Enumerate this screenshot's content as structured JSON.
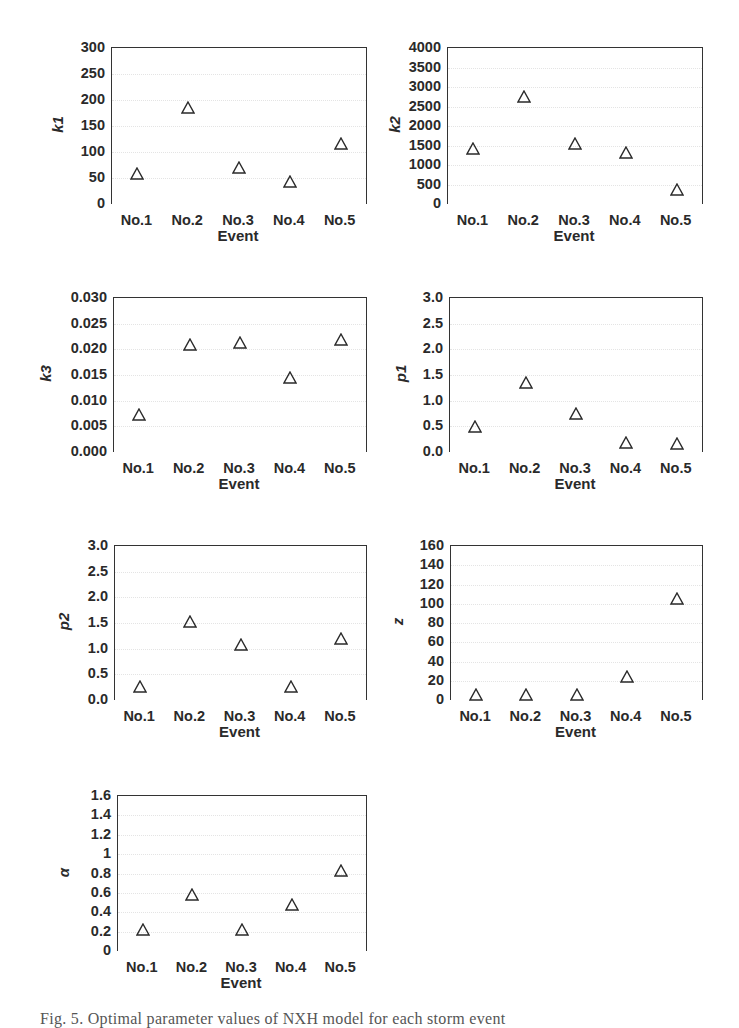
{
  "figure": {
    "caption": "Fig. 5. Optimal parameter values of NXH model for each storm event"
  },
  "chart_data": [
    {
      "type": "scatter",
      "id": "k1",
      "ylabel": "k1",
      "xlabel": "Event",
      "categories": [
        "No.1",
        "No.2",
        "No.3",
        "No.4",
        "No.5"
      ],
      "values": [
        58,
        185,
        70,
        43,
        115
      ],
      "ylim": [
        0,
        300
      ],
      "yticks": [
        "0",
        "50",
        "100",
        "150",
        "200",
        "250",
        "300"
      ],
      "marker": "open-triangle",
      "grid": true,
      "legend": null
    },
    {
      "type": "scatter",
      "id": "k2",
      "ylabel": "k2",
      "xlabel": "Event",
      "categories": [
        "No.1",
        "No.2",
        "No.3",
        "No.4",
        "No.5"
      ],
      "values": [
        1400,
        2750,
        1550,
        1300,
        350
      ],
      "ylim": [
        0,
        4000
      ],
      "yticks": [
        "0",
        "500",
        "1000",
        "1500",
        "2000",
        "2500",
        "3000",
        "3500",
        "4000"
      ],
      "marker": "open-triangle",
      "grid": true,
      "legend": null
    },
    {
      "type": "scatter",
      "id": "k3",
      "ylabel": "k3",
      "xlabel": "Event",
      "categories": [
        "No.1",
        "No.2",
        "No.3",
        "No.4",
        "No.5"
      ],
      "values": [
        0.0073,
        0.0208,
        0.0212,
        0.0145,
        0.0218
      ],
      "ylim": [
        0,
        0.03
      ],
      "yticks": [
        "0.000",
        "0.005",
        "0.010",
        "0.015",
        "0.020",
        "0.025",
        "0.030"
      ],
      "marker": "open-triangle",
      "grid": true,
      "legend": null
    },
    {
      "type": "scatter",
      "id": "p1",
      "ylabel": "p1",
      "xlabel": "Event",
      "categories": [
        "No.1",
        "No.2",
        "No.3",
        "No.4",
        "No.5"
      ],
      "values": [
        0.48,
        1.35,
        0.75,
        0.18,
        0.15
      ],
      "ylim": [
        0,
        3.0
      ],
      "yticks": [
        "0.0",
        "0.5",
        "1.0",
        "1.5",
        "2.0",
        "2.5",
        "3.0"
      ],
      "marker": "open-triangle",
      "grid": true,
      "legend": null
    },
    {
      "type": "scatter",
      "id": "p2",
      "ylabel": "p2",
      "xlabel": "Event",
      "categories": [
        "No.1",
        "No.2",
        "No.3",
        "No.4",
        "No.5"
      ],
      "values": [
        0.25,
        1.52,
        1.08,
        0.25,
        1.18
      ],
      "ylim": [
        0,
        3.0
      ],
      "yticks": [
        "0.0",
        "0.5",
        "1.0",
        "1.5",
        "2.0",
        "2.5",
        "3.0"
      ],
      "marker": "open-triangle",
      "grid": true,
      "legend": null
    },
    {
      "type": "scatter",
      "id": "z",
      "ylabel": "z",
      "xlabel": "Event",
      "categories": [
        "No.1",
        "No.2",
        "No.3",
        "No.4",
        "No.5"
      ],
      "values": [
        5,
        5,
        5,
        24,
        105
      ],
      "ylim": [
        0,
        160
      ],
      "yticks": [
        "0",
        "20",
        "40",
        "60",
        "80",
        "100",
        "120",
        "140",
        "160"
      ],
      "marker": "open-triangle",
      "grid": true,
      "legend": null
    },
    {
      "type": "scatter",
      "id": "alpha",
      "ylabel": "α",
      "xlabel": "Event",
      "categories": [
        "No.1",
        "No.2",
        "No.3",
        "No.4",
        "No.5"
      ],
      "values": [
        0.22,
        0.58,
        0.22,
        0.47,
        0.83
      ],
      "ylim": [
        0,
        1.6
      ],
      "yticks": [
        "0",
        "0.2",
        "0.4",
        "0.6",
        "0.8",
        "1",
        "1.2",
        "1.4",
        "1.6"
      ],
      "marker": "open-triangle",
      "grid": true,
      "legend": null
    }
  ],
  "layout": {
    "panels": [
      {
        "left": 111,
        "top": 47,
        "width": 254,
        "height": 156,
        "ylabel_x": 52
      },
      {
        "left": 447,
        "top": 47,
        "width": 254,
        "height": 156,
        "ylabel_x": 389
      },
      {
        "left": 113,
        "top": 297,
        "width": 252,
        "height": 154,
        "ylabel_x": 40
      },
      {
        "left": 449,
        "top": 297,
        "width": 252,
        "height": 154,
        "ylabel_x": 395
      },
      {
        "left": 114,
        "top": 545,
        "width": 251,
        "height": 154,
        "ylabel_x": 58
      },
      {
        "left": 450,
        "top": 545,
        "width": 251,
        "height": 154,
        "ylabel_x": 392
      },
      {
        "left": 117,
        "top": 795,
        "width": 248,
        "height": 155,
        "ylabel_x": 58
      }
    ]
  }
}
